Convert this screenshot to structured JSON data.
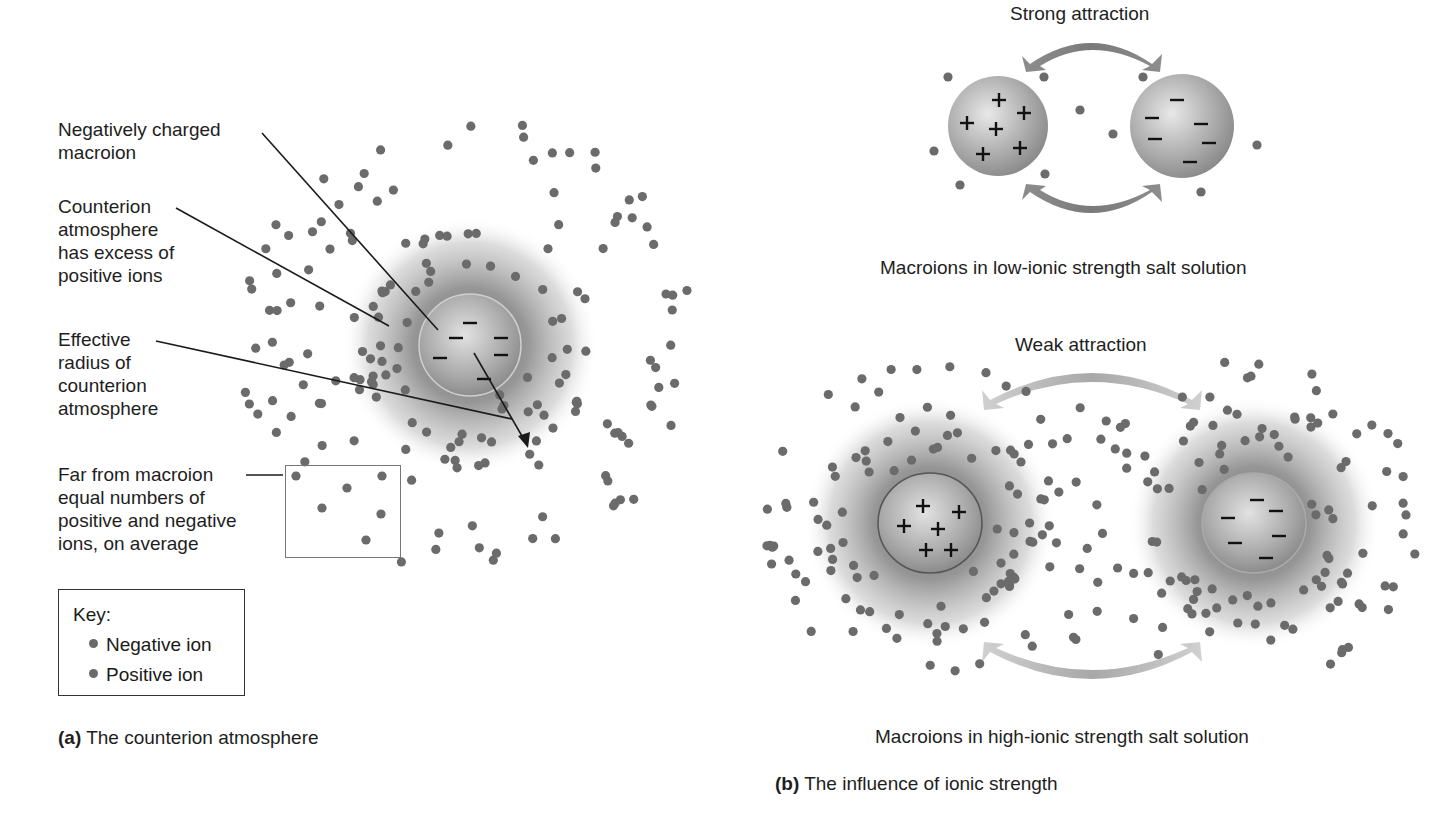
{
  "panel_a": {
    "labels": {
      "negatively_charged": "Negatively charged\nmacroion",
      "counterion_atmosphere": "Counterion\natmosphere\nhas excess of\npositive ions",
      "effective_radius": "Effective\nradius of\ncounterion\natmosphere",
      "far_from": "Far from macroion\nequal numbers of\npositive and negative\nions, on average"
    },
    "key": {
      "title": "Key:",
      "items": [
        {
          "label": "Negative ion",
          "color": "#6a6a6a"
        },
        {
          "label": "Positive ion",
          "color": "#6a6a6a"
        }
      ]
    },
    "caption_letter": "(a)",
    "caption_text": " The counterion atmosphere",
    "macroion": {
      "cx": 470,
      "cy": 345,
      "r": 50,
      "charge": "−",
      "charge_count": 6
    },
    "atmosphere": {
      "cx": 470,
      "cy": 345,
      "r": 125
    }
  },
  "panel_b": {
    "low": {
      "title": "Strong attraction",
      "caption": "Macroions in low-ionic strength salt solution",
      "left_ion": {
        "cx": 998,
        "cy": 126,
        "r": 50,
        "charge": "+",
        "charge_count": 6
      },
      "right_ion": {
        "cx": 1182,
        "cy": 126,
        "r": 52,
        "charge": "−",
        "charge_count": 6
      }
    },
    "high": {
      "title": "Weak attraction",
      "caption": "Macroions in high-ionic strength salt solution",
      "left_ion": {
        "cx": 930,
        "cy": 523,
        "r": 52,
        "charge": "+",
        "charge_count": 6
      },
      "right_ion": {
        "cx": 1254,
        "cy": 523,
        "r": 52,
        "charge": "−",
        "charge_count": 6
      }
    },
    "caption_letter": "(b)",
    "caption_text": " The influence of ionic strength"
  },
  "colors": {
    "ion_dot": "#6b6b6b",
    "macroion_fill": "#a8a8a8",
    "arrow_dark": "#8a8a8a",
    "arrow_light": "#c4c4c4",
    "text": "#1e1e1e"
  }
}
